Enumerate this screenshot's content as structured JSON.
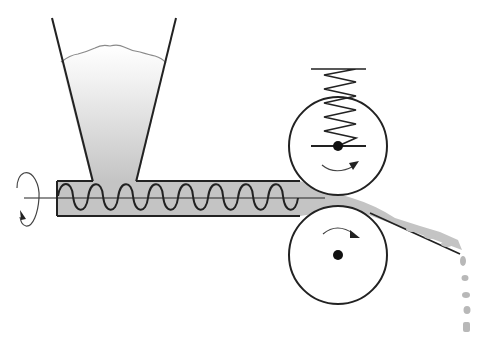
{
  "diagram": {
    "type": "schematic",
    "colors": {
      "stroke": "#222222",
      "material_fill": "#c4c4c4",
      "material_light": "#f4f4f4",
      "surface_line": "#8a8a8a",
      "background": "#ffffff"
    },
    "components": [
      {
        "id": "hopper",
        "label": ""
      },
      {
        "id": "barrel",
        "label": ""
      },
      {
        "id": "screw",
        "label": ""
      },
      {
        "id": "rotation-indicator",
        "label": ""
      },
      {
        "id": "top-roller",
        "label": ""
      },
      {
        "id": "spring",
        "label": ""
      },
      {
        "id": "bottom-roller",
        "label": ""
      },
      {
        "id": "output-ramp",
        "label": ""
      },
      {
        "id": "falling-pieces",
        "label": ""
      }
    ]
  }
}
